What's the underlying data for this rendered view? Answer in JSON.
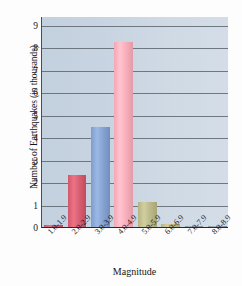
{
  "chart_data": {
    "type": "bar",
    "title": "",
    "xlabel": "Magnitude",
    "ylabel": "Number of Earthquakes (in thousands)",
    "categories": [
      "1.0-1.9",
      "2.0-2.9",
      "3.0-3.9",
      "4.0-4.9",
      "5.0-5.9",
      "6.0-6.9",
      "7.0-7.9",
      "8.0-8.9"
    ],
    "values": [
      0.07,
      2.3,
      4.45,
      8.25,
      1.1,
      0.15,
      0.02,
      0.01
    ],
    "ylim": [
      0,
      9.4
    ],
    "yticks": [
      0,
      1,
      2,
      3,
      4,
      5,
      6,
      7,
      8,
      9
    ],
    "ytick_labels": [
      "0",
      "1",
      "2",
      "3",
      "4",
      "5",
      "6",
      "7",
      "8",
      "9"
    ],
    "grid": true,
    "legend": "none",
    "bar_colors": [
      "#c8536a",
      "#d1576b",
      "#7f9ccb",
      "#f0a8b4",
      "#b5b383",
      "#b5b383",
      "#8d9aa4",
      "#8d9aa4"
    ],
    "plot_background": "#c8d4e1",
    "gridline_color": "#5d6670",
    "axis_color": "#2a2a2a"
  }
}
